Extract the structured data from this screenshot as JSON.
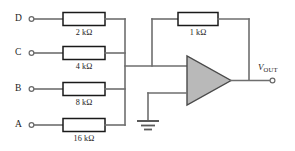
{
  "diagram": {
    "type": "schematic",
    "inputs": [
      {
        "label": "D",
        "resistor": "2 kΩ",
        "terminal": "input-terminal-d"
      },
      {
        "label": "C",
        "resistor": "4 kΩ",
        "terminal": "input-terminal-c"
      },
      {
        "label": "B",
        "resistor": "8 kΩ",
        "terminal": "input-terminal-b"
      },
      {
        "label": "A",
        "resistor": "16 kΩ",
        "terminal": "input-terminal-a"
      }
    ],
    "feedback": {
      "label": "1 kΩ",
      "name": "feedback-resistor"
    },
    "opamp": {
      "name": "operational-amplifier",
      "inverting_input": "-",
      "noninverting_input": "+"
    },
    "ground": {
      "name": "ground-symbol"
    },
    "output": {
      "label_main": "V",
      "label_sub": "OUT",
      "terminal": "output-terminal"
    },
    "colors": {
      "wire": "#6e6e6e",
      "resistor_outline": "#1a1a1a",
      "amp_fill": "#b9b9b9",
      "amp_outline": "#4a4a4a",
      "text": "#1c1c1c",
      "background": "#ffffff"
    }
  }
}
